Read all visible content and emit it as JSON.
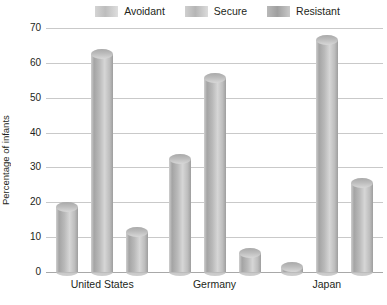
{
  "chart_data": {
    "type": "bar",
    "title": "",
    "xlabel": "",
    "ylabel": "Percentage of infants",
    "categories": [
      "United States",
      "Germany",
      "Japan"
    ],
    "series": [
      {
        "name": "Avoidant",
        "values": [
          20,
          34,
          3
        ],
        "color": "#bfbfbf"
      },
      {
        "name": "Secure",
        "values": [
          64,
          57,
          68
        ],
        "color": "#bdbdbd"
      },
      {
        "name": "Resistant",
        "values": [
          13,
          7,
          27
        ],
        "color": "#a8a8a8"
      }
    ],
    "ylim": [
      0,
      70
    ],
    "yticks": [
      0,
      10,
      20,
      30,
      40,
      50,
      60,
      70
    ],
    "ytick_labels": [
      "0",
      "10",
      "20",
      "30",
      "40",
      "50",
      "60",
      "70"
    ],
    "grid": true,
    "legend_position": "top"
  },
  "legend": {
    "items": [
      {
        "label": "Avoidant"
      },
      {
        "label": "Secure"
      },
      {
        "label": "Resistant"
      }
    ]
  },
  "axes": {
    "y_title": "Percentage of infants"
  }
}
